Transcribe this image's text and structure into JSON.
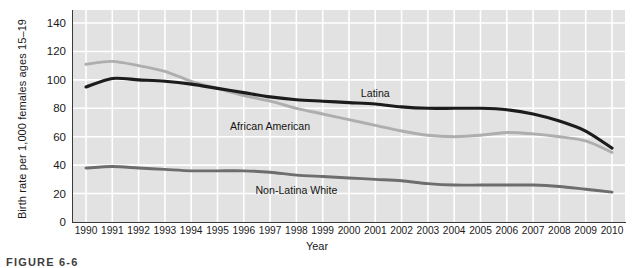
{
  "figure": {
    "caption": "FIGURE 6-6"
  },
  "chart_data": {
    "type": "line",
    "title": "",
    "xlabel": "Year",
    "ylabel": "Birth rate per 1,000 females ages 15–19",
    "grid": true,
    "legend_position": "inline-annotations",
    "xlim": [
      1990,
      2010
    ],
    "ylim": [
      0,
      140
    ],
    "yticks": [
      0,
      20,
      40,
      60,
      80,
      100,
      120,
      140
    ],
    "categories": [
      "1990",
      "1991",
      "1992",
      "1993",
      "1994",
      "1995",
      "1996",
      "1997",
      "1998",
      "1999",
      "2000",
      "2001",
      "2002",
      "2003",
      "2004",
      "2005",
      "2006",
      "2007",
      "2008",
      "2009",
      "2010"
    ],
    "series": [
      {
        "name": "Latina",
        "color": "#1c1c1c",
        "values": [
          95,
          101,
          100,
          99,
          97,
          94,
          91,
          88,
          86,
          85,
          84,
          83,
          81,
          80,
          80,
          80,
          79,
          76,
          71,
          64,
          52
        ]
      },
      {
        "name": "African American",
        "color": "#aeaeae",
        "values": [
          111,
          113,
          110,
          106,
          99,
          94,
          89,
          85,
          80,
          76,
          72,
          68,
          64,
          61,
          60,
          61,
          63,
          62,
          60,
          57,
          49
        ]
      },
      {
        "name": "Non-Latina White",
        "color": "#6d6d6d",
        "values": [
          38,
          39,
          38,
          37,
          36,
          36,
          36,
          35,
          33,
          32,
          31,
          30,
          29,
          27,
          26,
          26,
          26,
          26,
          25,
          23,
          21
        ]
      }
    ],
    "annotations": [
      {
        "text": "Latina",
        "x": 2001,
        "y": 90
      },
      {
        "text": "African American",
        "x": 1997,
        "y": 67
      },
      {
        "text": "Non-Latina White",
        "x": 1998,
        "y": 22
      }
    ]
  }
}
